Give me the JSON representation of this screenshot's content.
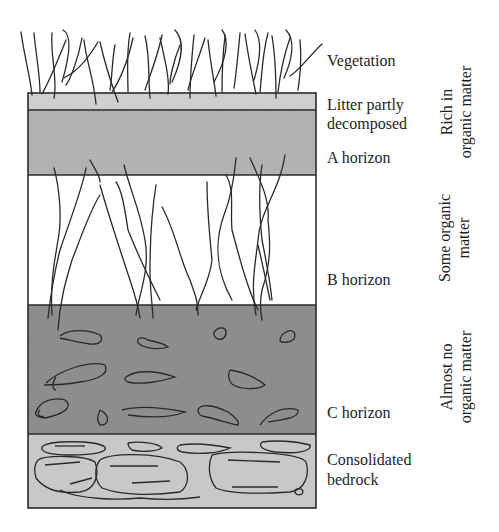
{
  "diagram": {
    "type": "soil-profile",
    "layers": [
      {
        "id": "vegetation",
        "label": "Vegetation",
        "fill": null
      },
      {
        "id": "litter",
        "label_line1": "Litter partly",
        "label_line2": "decomposed",
        "fill": "#cfcfcf"
      },
      {
        "id": "a_horizon",
        "label": "A horizon",
        "fill": "#b4b4b4"
      },
      {
        "id": "b_horizon",
        "label": "B horizon",
        "fill": "#ffffff"
      },
      {
        "id": "c_horizon",
        "label": "C horizon",
        "fill": "#8f8f8f"
      },
      {
        "id": "bedrock",
        "label_line1": "Consolidated",
        "label_line2": "bedrock",
        "fill": "#c8c8c8"
      }
    ],
    "organic_matter_zones": [
      {
        "line1": "Rich in",
        "line2": "organic matter"
      },
      {
        "line1": "Some organic",
        "line2": "matter"
      },
      {
        "line1": "Almost no",
        "line2": "organic matter"
      }
    ],
    "colors": {
      "stroke": "#2a2a2a",
      "litter": "#cfcfcf",
      "a_horizon": "#b4b4b4",
      "b_horizon": "#ffffff",
      "c_horizon": "#8f8f8f",
      "bedrock": "#c8c8c8"
    }
  }
}
